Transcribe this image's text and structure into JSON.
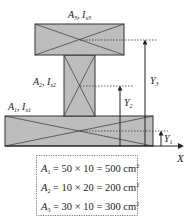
{
  "diagram": {
    "type": "composite-section-centroid",
    "colors": {
      "fill": "#bdbdbd",
      "stroke": "#333333",
      "text": "#222222"
    },
    "parts": [
      {
        "id": "A1",
        "label_main": "A",
        "label_sub": "1",
        "inertia_main": "I",
        "inertia_sub": "x1"
      },
      {
        "id": "A2",
        "label_main": "A",
        "label_sub": "2",
        "inertia_main": "I",
        "inertia_sub": "x2"
      },
      {
        "id": "A3",
        "label_main": "A",
        "label_sub": "3",
        "inertia_main": "I",
        "inertia_sub": "x3"
      }
    ],
    "distances": [
      {
        "main": "Y",
        "sub": "1"
      },
      {
        "main": "Y",
        "sub": "2"
      },
      {
        "main": "Y",
        "sub": "3"
      }
    ],
    "axis_label": "X",
    "equations": [
      {
        "lhs": "A",
        "sub": "1",
        "expr": " = 50 × 10 = 500 cm",
        "sup": "2"
      },
      {
        "lhs": "A",
        "sub": "2",
        "expr": " = 10 × 20 = 200 cm",
        "sup": "2"
      },
      {
        "lhs": "A",
        "sub": "3",
        "expr": " = 30 × 10 = 300 cm",
        "sup": "2"
      }
    ]
  }
}
